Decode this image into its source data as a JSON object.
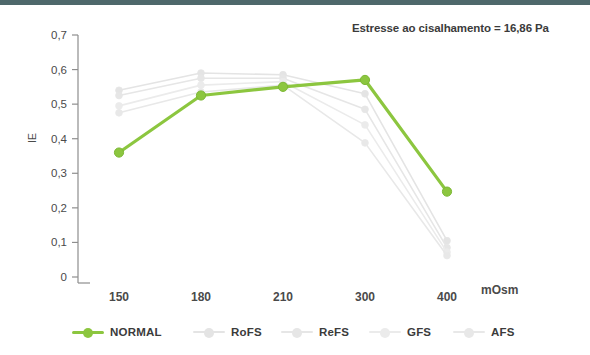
{
  "colors": {
    "top_bar": "#4e686b",
    "normal_green": "#8cc63f",
    "faded_gray": "#e9e9e9",
    "axis": "#8e8e8e",
    "text": "#3b3b3b"
  },
  "annotation": {
    "text": "Estresse ao cisalhamento = 16,86 Pa"
  },
  "axes": {
    "y_label": "IE",
    "x_unit": "mOsm",
    "y_ticks": [
      "0",
      "0,1",
      "0,2",
      "0,3",
      "0,4",
      "0,5",
      "0,6",
      "0,7"
    ],
    "x_ticks": [
      "150",
      "180",
      "210",
      "300",
      "400"
    ]
  },
  "legend": {
    "items": [
      {
        "label": "NORMAL",
        "color": "#8cc63f"
      },
      {
        "label": "RoFS",
        "color": "#e4e4e4"
      },
      {
        "label": "ReFS",
        "color": "#e6e6e6"
      },
      {
        "label": "GFS",
        "color": "#ebebeb"
      },
      {
        "label": "AFS",
        "color": "#e8e8e8"
      }
    ]
  },
  "chart_data": {
    "type": "line",
    "title": "",
    "subtitle": "",
    "annotation": "Estresse ao cisalhamento = 16,86 Pa",
    "xlabel": "mOsm",
    "ylabel": "IE",
    "categories": [
      "150",
      "180",
      "210",
      "300",
      "400"
    ],
    "ylim": [
      0,
      0.7
    ],
    "ytick_values": [
      0,
      0.1,
      0.2,
      0.3,
      0.4,
      0.5,
      0.6,
      0.7
    ],
    "grid": false,
    "legend_position": "bottom",
    "series": [
      {
        "name": "NORMAL",
        "color": "#8cc63f",
        "emphasis": true,
        "values": [
          0.36,
          0.525,
          0.55,
          0.57,
          0.247
        ]
      },
      {
        "name": "RoFS",
        "color": "#e4e4e4",
        "emphasis": false,
        "values": [
          0.54,
          0.59,
          0.585,
          0.53,
          0.105
        ]
      },
      {
        "name": "ReFS",
        "color": "#e6e6e6",
        "emphasis": false,
        "values": [
          0.525,
          0.575,
          0.575,
          0.485,
          0.085
        ]
      },
      {
        "name": "GFS",
        "color": "#ebebeb",
        "emphasis": false,
        "values": [
          0.495,
          0.555,
          0.565,
          0.44,
          0.072
        ]
      },
      {
        "name": "AFS",
        "color": "#e8e8e8",
        "emphasis": false,
        "values": [
          0.475,
          0.535,
          0.555,
          0.388,
          0.062
        ]
      }
    ]
  }
}
